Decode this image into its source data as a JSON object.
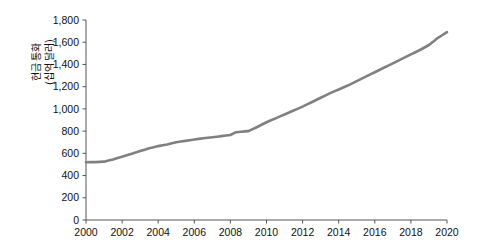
{
  "chart_data": {
    "type": "line",
    "title": "",
    "xlabel": "",
    "ylabel_lines": [
      "현금 통화",
      "(십억 달러)"
    ],
    "ylabel": "현금 통화 (십억 달러)",
    "grid": false,
    "legend": "none",
    "line_color": "#808080",
    "axis_color": "#555555",
    "xlim": [
      2000,
      2020
    ],
    "ylim": [
      0,
      1800
    ],
    "xticks": [
      2000,
      2002,
      2004,
      2006,
      2008,
      2010,
      2012,
      2014,
      2016,
      2018,
      2020
    ],
    "xtick_labels": [
      "2000",
      "2002",
      "2004",
      "2006",
      "2008",
      "2010",
      "2012",
      "2014",
      "2016",
      "2018",
      "2020"
    ],
    "yticks": [
      0,
      200,
      400,
      600,
      800,
      1000,
      1200,
      1400,
      1600,
      1800
    ],
    "ytick_labels": [
      "0",
      "200",
      "400",
      "600",
      "800",
      "1,000",
      "1,200",
      "1,400",
      "1,600",
      "1,800"
    ],
    "series": [
      {
        "name": "현금 통화",
        "x": [
          2000,
          2000.5,
          2001,
          2001.5,
          2002,
          2002.5,
          2003,
          2003.5,
          2004,
          2004.5,
          2005,
          2005.5,
          2006,
          2006.5,
          2007,
          2007.5,
          2008,
          2008.3,
          2008.6,
          2009,
          2009.4,
          2010,
          2010.5,
          2011,
          2011.5,
          2012,
          2012.5,
          2013,
          2013.5,
          2014,
          2014.5,
          2015,
          2015.5,
          2016,
          2016.5,
          2017,
          2017.5,
          2018,
          2018.5,
          2019,
          2019.5,
          2020
        ],
        "values": [
          520,
          521,
          525,
          545,
          570,
          595,
          620,
          645,
          665,
          680,
          700,
          712,
          725,
          735,
          745,
          755,
          765,
          790,
          795,
          800,
          830,
          880,
          915,
          950,
          985,
          1020,
          1060,
          1100,
          1140,
          1175,
          1210,
          1250,
          1290,
          1330,
          1370,
          1410,
          1450,
          1490,
          1530,
          1575,
          1640,
          1690
        ]
      }
    ]
  },
  "geometry": {
    "plot_left": 86,
    "plot_right": 447,
    "plot_top": 20,
    "plot_bottom": 220
  }
}
